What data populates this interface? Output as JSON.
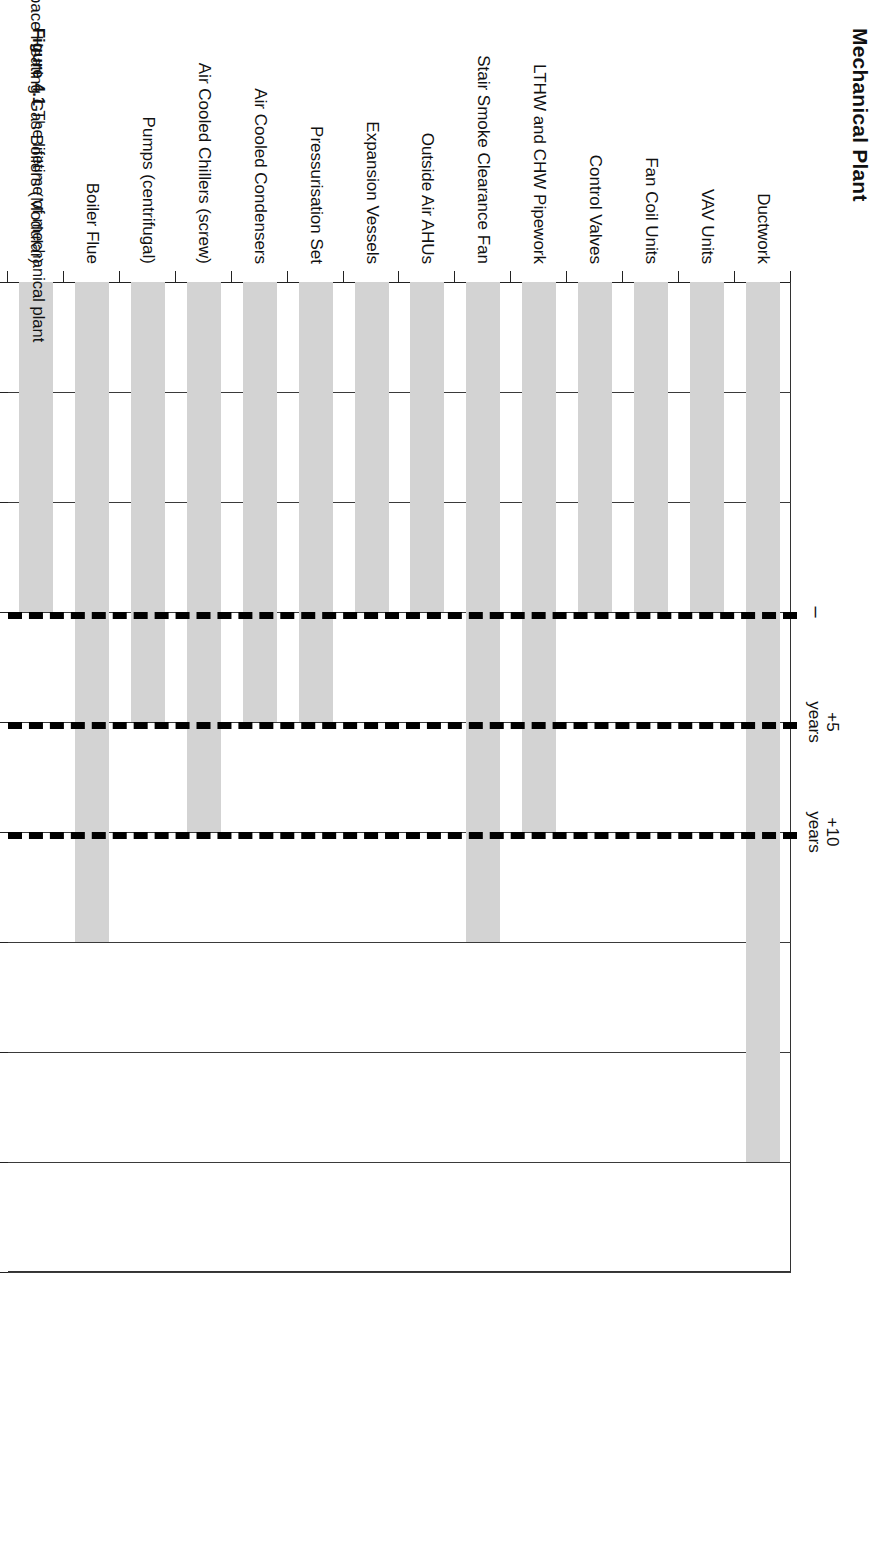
{
  "chart_title": "Mechanical Plant",
  "figure_caption": {
    "number": "Figure 4.1",
    "text": " The lifetime of mechanical plant"
  },
  "annotations": [
    {
      "name": "now-marker",
      "label_line1": "–",
      "label_line2": "",
      "at_year": 2012
    },
    {
      "name": "plus5-years",
      "label_line1": "+5",
      "label_line2": "years",
      "at_year": 2017
    },
    {
      "name": "plus10-years",
      "label_line1": "+10",
      "label_line2": "years",
      "at_year": 2022
    }
  ],
  "colors": {
    "bar_fill": "#d3d3d3",
    "gridline": "#3a3a3a",
    "dashed_marker": "#000000",
    "axis": "#222222",
    "background": "#ffffff"
  },
  "chart_data": {
    "type": "bar",
    "orientation": "horizontal",
    "title": "Mechanical Plant",
    "xlabel": "",
    "ylabel": "",
    "xlim": [
      1997,
      2042
    ],
    "baseline": 1997,
    "grid": true,
    "legend": null,
    "xticks": [
      1997,
      2002,
      2007,
      2012,
      2017,
      2022,
      2027,
      2032,
      2037,
      2042
    ],
    "tick_labels": [
      "1997",
      "2002",
      "2007",
      "2012",
      "2017",
      "2022",
      "2027",
      "2032",
      "2037",
      "2042"
    ],
    "dashed_marker_years": [
      2012,
      2017,
      2022
    ],
    "categories": [
      "Ductwork",
      "VAV Units",
      "Fan Coil Units",
      "Control Valves",
      "LTHW and CHW Pipework",
      "Stair Smoke Clearance Fan",
      "Outside Air AHUs",
      "Expansion Vessels",
      "Pressurisation Set",
      "Air Cooled Condensers",
      "Air Cooled Chillers (screw)",
      "Pumps (centrifugal)",
      "Boiler Flue",
      "Space Heating Gas Boilers (Modular)"
    ],
    "values": [
      2037,
      2012,
      2012,
      2012,
      2022,
      2027,
      2012,
      2012,
      2017,
      2017,
      2022,
      2017,
      2027,
      2012
    ],
    "value_unit": "year of end of life"
  }
}
